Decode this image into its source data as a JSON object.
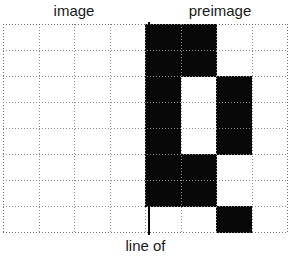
{
  "labels": {
    "left_top": "image",
    "right_top": "preimage",
    "bottom": "line of"
  },
  "colors": {
    "filled_cell": "#080808",
    "empty_cell": "#ffffff",
    "gridline": "#8c8c8c",
    "mirror_line": "#000000",
    "text": "#1a1a1a"
  },
  "grid": {
    "columns": 8,
    "rows": 8,
    "cell_width_px": 35.5,
    "cell_height_px": 26,
    "origin_x_px": 3,
    "origin_y_px": 24,
    "gridline_style": "dotted"
  },
  "mirror_line": {
    "label": "line of",
    "after_column": 4,
    "x_px": 148,
    "top_px": 22,
    "height_px": 213,
    "thickness_px": 2
  },
  "chart_data": {
    "type": "heatmap",
    "title": "",
    "xlabel": "",
    "ylabel": "",
    "legend": [
      "image",
      "preimage"
    ],
    "annotations": [
      "image",
      "preimage",
      "line of"
    ],
    "grid": true,
    "columns": 8,
    "rows": 8,
    "values": [
      [
        0,
        0,
        0,
        0,
        1,
        1,
        0,
        0
      ],
      [
        0,
        0,
        0,
        0,
        1,
        1,
        0,
        0
      ],
      [
        0,
        0,
        0,
        0,
        1,
        0,
        1,
        0
      ],
      [
        0,
        0,
        0,
        0,
        1,
        0,
        1,
        0
      ],
      [
        0,
        0,
        0,
        0,
        1,
        0,
        1,
        0
      ],
      [
        0,
        0,
        0,
        0,
        1,
        1,
        0,
        0
      ],
      [
        0,
        0,
        0,
        0,
        1,
        1,
        0,
        0
      ],
      [
        0,
        0,
        0,
        0,
        0,
        0,
        1,
        0
      ]
    ]
  }
}
